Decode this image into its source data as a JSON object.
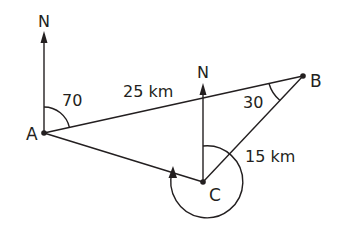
{
  "diagram": {
    "type": "bearing-triangle",
    "points": {
      "A": {
        "label": "A"
      },
      "B": {
        "label": "B"
      },
      "C": {
        "label": "C"
      }
    },
    "north_labels": {
      "at_A": "N",
      "at_C": "N"
    },
    "angles": {
      "bearing_A_to_B": "70",
      "angle_at_B": "30"
    },
    "distances": {
      "AB": "25 km",
      "BC": "15 km"
    },
    "colors": {
      "ink": "#231f20",
      "background": "#ffffff"
    }
  }
}
